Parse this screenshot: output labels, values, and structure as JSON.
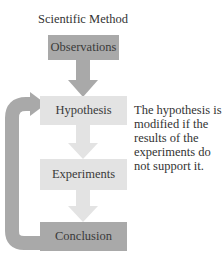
{
  "title": "Scientific Method",
  "steps": [
    {
      "label": "Observations",
      "style": "dark"
    },
    {
      "label": "Hypothesis",
      "style": "light"
    },
    {
      "label": "Experiments",
      "style": "light"
    },
    {
      "label": "Conclusion",
      "style": "dark"
    }
  ],
  "note": "The hypothesis is modified if the results of the experiments do not support it.",
  "colors": {
    "dark_box": "#a9a9a9",
    "light_box": "#e3e3e3",
    "feedback_arrow": "#a9a9a9",
    "flow_arrow_dark": "#a9a9a9",
    "flow_arrow_light": "#e3e3e3"
  }
}
